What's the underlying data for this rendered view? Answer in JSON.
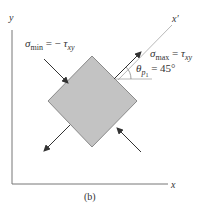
{
  "diagram": {
    "axes": {
      "y_label": "y",
      "x_label": "x",
      "rotated_axis_label": "x′"
    },
    "element": {
      "fill": "#c3c3c3",
      "stroke": "#8a8a8a"
    },
    "labels": {
      "sigma_min": {
        "symbol": "σ",
        "sub": "min",
        "eq": " = − ",
        "tau": "τ",
        "tau_sub": "xy"
      },
      "sigma_max": {
        "symbol": "σ",
        "sub": "max",
        "eq": " = ",
        "tau": "τ",
        "tau_sub": "xy"
      },
      "theta": {
        "symbol": "θ",
        "sub": "p",
        "subsub": "1",
        "eq": " = 45°"
      }
    },
    "caption": "(b)",
    "colors": {
      "axis": "#777777",
      "arrow": "#333333",
      "text": "#333333"
    }
  }
}
